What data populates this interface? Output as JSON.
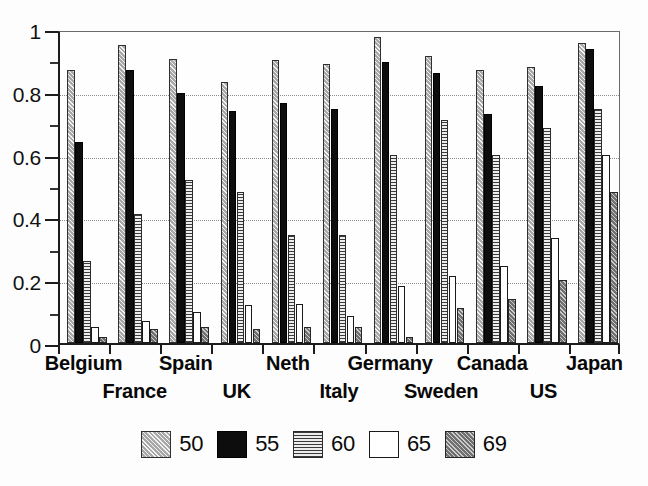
{
  "chart_data": {
    "type": "bar",
    "title": "",
    "subtitle": "",
    "xlabel": "",
    "ylabel": "",
    "ylim": [
      0,
      1
    ],
    "xlim_note": "grouped categorical",
    "grid": "horizontal dotted gridlines at 0.2 intervals",
    "legend_position": "bottom-center",
    "y_ticks_major": [
      "0",
      "0.2",
      "0.4",
      "0.6",
      "0.8",
      "1"
    ],
    "y_tick_values_major": [
      0,
      0.2,
      0.4,
      0.6,
      0.8,
      1
    ],
    "y_tick_values_minor": [
      0.1,
      0.3,
      0.5,
      0.7,
      0.9
    ],
    "categories": [
      "Belgium",
      "France",
      "Spain",
      "UK",
      "Neth",
      "Italy",
      "Germany",
      "Sweden",
      "Canada",
      "US",
      "Japan"
    ],
    "series": [
      {
        "name": "50",
        "pattern": "diagonal-hatch-light",
        "color": "#a8a8a8",
        "values": [
          0.87,
          0.95,
          0.905,
          0.83,
          0.9,
          0.89,
          0.975,
          0.915,
          0.87,
          0.88,
          0.955
        ]
      },
      {
        "name": "55",
        "pattern": "solid-black",
        "color": "#0d0d0d",
        "values": [
          0.64,
          0.87,
          0.795,
          0.74,
          0.765,
          0.745,
          0.895,
          0.86,
          0.73,
          0.82,
          0.935
        ]
      },
      {
        "name": "60",
        "pattern": "horizontal-lines",
        "color": "#d9d9d9",
        "values": [
          0.26,
          0.41,
          0.52,
          0.48,
          0.345,
          0.345,
          0.6,
          0.71,
          0.6,
          0.685,
          0.745
        ]
      },
      {
        "name": "65",
        "pattern": "empty-white",
        "color": "#ffffff",
        "values": [
          0.05,
          0.07,
          0.1,
          0.12,
          0.125,
          0.085,
          0.18,
          0.215,
          0.245,
          0.335,
          0.6
        ]
      },
      {
        "name": "69",
        "pattern": "diagonal-hatch-dark",
        "color": "#8f8f8f",
        "values": [
          0.02,
          0.045,
          0.05,
          0.045,
          0.05,
          0.05,
          0.02,
          0.11,
          0.14,
          0.2,
          0.48
        ]
      }
    ]
  },
  "legend": {
    "items": [
      {
        "label": "50",
        "swatch": "diagonal-hatch-light-swatch"
      },
      {
        "label": "55",
        "swatch": "solid-black-swatch"
      },
      {
        "label": "60",
        "swatch": "horizontal-lines-swatch"
      },
      {
        "label": "65",
        "swatch": "empty-white-swatch"
      },
      {
        "label": "69",
        "swatch": "diagonal-hatch-dark-swatch"
      }
    ]
  }
}
